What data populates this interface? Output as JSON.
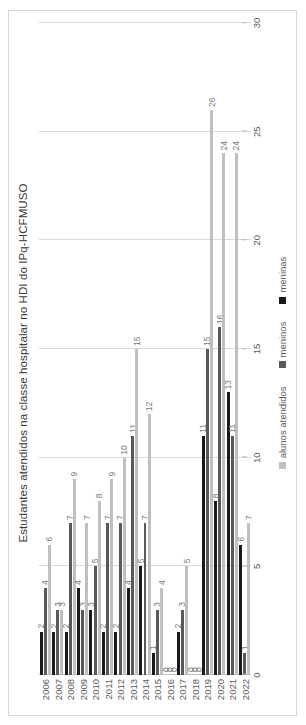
{
  "chart_data": {
    "type": "bar",
    "orientation": "horizontal",
    "title": "Estudantes atendidos na classe hospitalar no HDI do IPq-HCFMUSO",
    "xlabel": "",
    "ylabel": "",
    "xlim": [
      0,
      30
    ],
    "grid": true,
    "legend_position": "bottom",
    "categories": [
      "2006",
      "2007",
      "2008",
      "2009",
      "2010",
      "2011",
      "2012",
      "2013",
      "2014",
      "2015",
      "2016",
      "2017",
      "2018",
      "2019",
      "2020",
      "2021",
      "2022"
    ],
    "tick_labels": [
      "0",
      "5",
      "10",
      "15",
      "20",
      "25",
      "30"
    ],
    "tick_values": [
      0,
      5,
      10,
      15,
      20,
      25,
      30
    ],
    "series": [
      {
        "name": "alunos atendidos",
        "color": "#bfbfbf",
        "values": [
          6,
          3,
          9,
          7,
          8,
          9,
          10,
          15,
          12,
          4,
          0,
          5,
          0,
          26,
          24,
          24,
          7
        ]
      },
      {
        "name": "meninos",
        "color": "#595959",
        "values": [
          4,
          3,
          7,
          3,
          5,
          7,
          7,
          11,
          7,
          3,
          0,
          3,
          0,
          15,
          16,
          11,
          1
        ]
      },
      {
        "name": "meninas",
        "color": "#1a1a1a",
        "values": [
          2,
          2,
          2,
          4,
          3,
          2,
          2,
          4,
          5,
          1,
          0,
          2,
          0,
          11,
          8,
          13,
          6
        ]
      }
    ]
  },
  "legend": {
    "items": [
      {
        "label": "alunos atendidos"
      },
      {
        "label": "meninos"
      },
      {
        "label": "meninas"
      }
    ]
  }
}
